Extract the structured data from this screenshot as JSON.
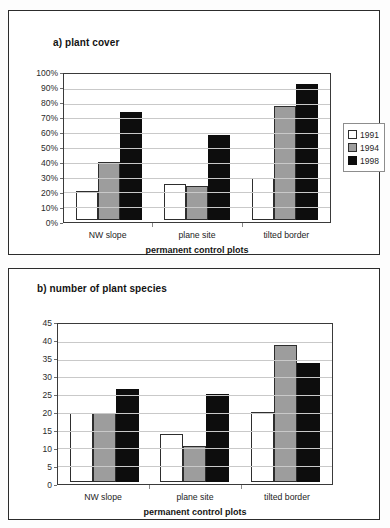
{
  "figure": {
    "background": "#ffffff",
    "series_colors": {
      "1991": "#ffffff",
      "1994": "#9d9d9d",
      "1998": "#0d0d0d"
    }
  },
  "chart_data": [
    {
      "id": "a",
      "type": "bar",
      "title": "a) plant cover",
      "xlabel": "permanent control plots",
      "ylabel": "",
      "categories": [
        "NW slope",
        "plane site",
        "tilted border"
      ],
      "ylim": [
        0,
        100
      ],
      "ytick_values": [
        0,
        10,
        20,
        30,
        40,
        50,
        60,
        70,
        80,
        90,
        100
      ],
      "ytick_labels": [
        "0%",
        "10%",
        "20%",
        "30%",
        "40%",
        "50%",
        "60%",
        "70%",
        "80%",
        "90%",
        "100%"
      ],
      "grid": true,
      "legend_position": "right",
      "series": [
        {
          "name": "1991",
          "color": "#ffffff",
          "values": [
            20,
            25,
            29
          ]
        },
        {
          "name": "1994",
          "color": "#9d9d9d",
          "values": [
            40,
            24,
            79
          ]
        },
        {
          "name": "1998",
          "color": "#0d0d0d",
          "values": [
            75,
            59,
            94
          ]
        }
      ]
    },
    {
      "id": "b",
      "type": "bar",
      "title": "b) number of plant species",
      "xlabel": "permanent control plots",
      "ylabel": "",
      "categories": [
        "NW slope",
        "plane site",
        "tilted border"
      ],
      "ylim": [
        0,
        45
      ],
      "ytick_values": [
        0,
        5,
        10,
        15,
        20,
        25,
        30,
        35,
        40,
        45
      ],
      "ytick_labels": [
        "0",
        "5",
        "10",
        "15",
        "20",
        "25",
        "30",
        "35",
        "40",
        "45"
      ],
      "grid": true,
      "legend_position": "right",
      "series": [
        {
          "name": "1991",
          "color": "#ffffff",
          "values": [
            20,
            14,
            20.3
          ]
        },
        {
          "name": "1994",
          "color": "#9d9d9d",
          "values": [
            20,
            10.5,
            39.5
          ]
        },
        {
          "name": "1998",
          "color": "#0d0d0d",
          "values": [
            26.7,
            25.5,
            34.3
          ]
        }
      ]
    }
  ]
}
